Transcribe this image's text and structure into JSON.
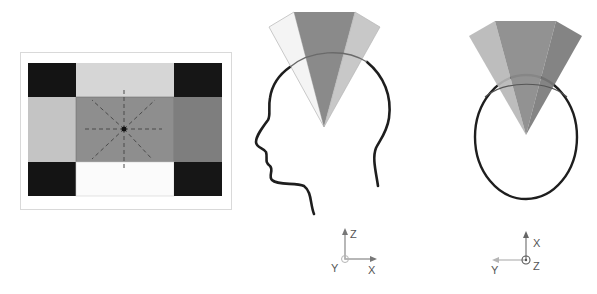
{
  "colors": {
    "black_block": "#141414",
    "light_top": "#d6d6d6",
    "light_left": "#c4c4c4",
    "center": "#8e8e8e",
    "right_mid": "#7e7e7e",
    "bottom_white": "#fbfbfb",
    "frame": "#d9d9d9",
    "cone_center": "#8a8a8a",
    "cone_left_side": "#f4f4f4",
    "cone_right_side": "#c8c8c8",
    "cone_top_left": "#b7b7b7",
    "cone_top_right": "#7a7a7a",
    "outline": "#1e1e1e",
    "axis": "#888888",
    "axis_light": "#b5b5b5"
  },
  "panels": {
    "screen_grid": {
      "name": "frontal-screen-grid"
    },
    "side_view": {
      "name": "head-side-view"
    },
    "top_view": {
      "name": "head-top-view"
    }
  },
  "axes": {
    "side": {
      "up": "Z",
      "right": "X",
      "out": "Y"
    },
    "top": {
      "up": "X",
      "left": "Y",
      "out": "Z"
    }
  }
}
